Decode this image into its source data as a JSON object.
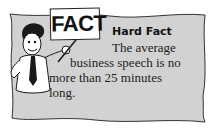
{
  "callout": {
    "sign_text": "FACT",
    "title": "Hard Fact",
    "lines": [
      "The average",
      "business speech is no",
      "more than 25 minutes",
      "long."
    ],
    "colors": {
      "panel_fill": "#d2d2d2",
      "ink": "#1a1a1a",
      "sign_fill": "#ffffff"
    }
  }
}
